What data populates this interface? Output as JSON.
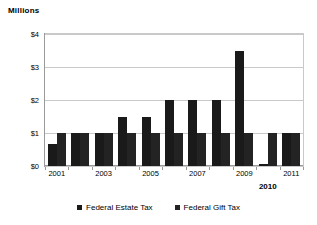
{
  "chart_data": {
    "type": "bar",
    "title": "",
    "subtitle": "",
    "unit_label": "Millions",
    "xlabel": "",
    "ylabel": "",
    "ylim": [
      0,
      4
    ],
    "grid": true,
    "legend_position": "bottom",
    "categories": [
      "2001",
      "2002",
      "2003",
      "2004",
      "2005",
      "2006",
      "2007",
      "2008",
      "2009",
      "2010",
      "2011"
    ],
    "x_tick_labels": [
      "2001",
      "",
      "2003",
      "",
      "2005",
      "",
      "2007",
      "",
      "2009",
      "2010",
      "2011"
    ],
    "y_tick_labels": [
      "$0",
      "$1",
      "$2",
      "$3",
      "$4"
    ],
    "y_tick_values": [
      0,
      1,
      2,
      3,
      4
    ],
    "emphasized_category": "2010",
    "series": [
      {
        "name": "Federal Estate Tax",
        "color": "#1a1a1a",
        "values": [
          0.675,
          1.0,
          1.0,
          1.5,
          1.5,
          2.0,
          2.0,
          2.0,
          3.5,
          0.0,
          1.0
        ]
      },
      {
        "name": "Federal Gift Tax",
        "color": "#232323",
        "values": [
          1.0,
          1.0,
          1.0,
          1.0,
          1.0,
          1.0,
          1.0,
          1.0,
          1.0,
          1.0,
          1.0
        ]
      }
    ]
  }
}
